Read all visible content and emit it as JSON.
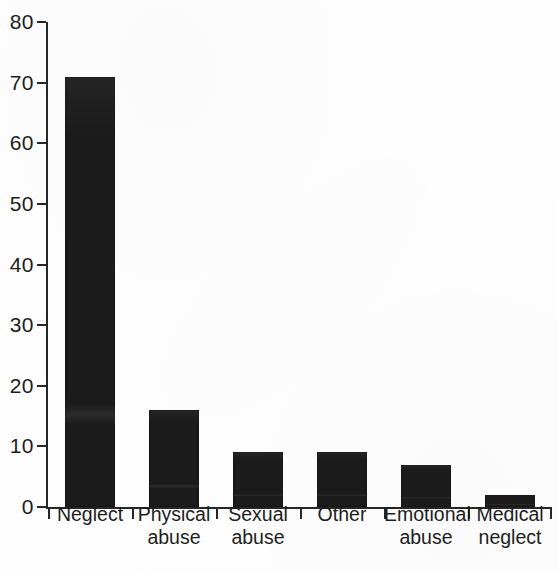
{
  "chart_data": {
    "type": "bar",
    "title": "",
    "xlabel": "",
    "ylabel": "",
    "categories": [
      "Neglect",
      "Physical\nabuse",
      "Sexual\nabuse",
      "Other",
      "Emotional\nabuse",
      "Medical\nneglect"
    ],
    "values": [
      71,
      16,
      9,
      9,
      7,
      2
    ],
    "ylim": [
      0,
      80
    ],
    "ytick_labels": [
      "0",
      "10",
      "20",
      "30",
      "40",
      "50",
      "60",
      "70",
      "80"
    ],
    "ytick_values": [
      0,
      10,
      20,
      30,
      40,
      50,
      60,
      70,
      80
    ],
    "grid": false,
    "legend": null,
    "bar_color": "#1b1b1b",
    "axis_color": "#262626",
    "background_color": "#fefefe"
  }
}
